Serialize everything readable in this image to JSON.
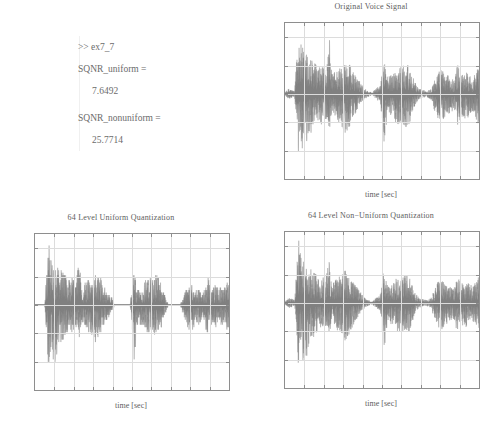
{
  "console": {
    "prompt_line": ">> ex7_7",
    "var1_name": "SQNR_uniform =",
    "var1_value": "7.6492",
    "var2_name": "SQNR_nonuniform =",
    "var2_value": "25.7714"
  },
  "colors": {
    "waveform": "#808080",
    "axis": "#8e8e8e",
    "grid": "#dcdcdc",
    "text": "#5d5d5d"
  },
  "figures": [
    {
      "id": "original-voice-signal",
      "title": "Original Voice Signal",
      "xlabel": "time [sec]",
      "ylabel": "",
      "xticks": [
        "1",
        "2",
        "3",
        "4",
        "5",
        "6",
        "7",
        "8",
        "9",
        "10"
      ],
      "yticks": [
        "0.2",
        "0.1",
        "0",
        "-0.1",
        "-0.2",
        "-0.3"
      ]
    },
    {
      "id": "uniform-quantization",
      "title": "64 Level Uniform Quantization",
      "xlabel": "time [sec]",
      "ylabel": "",
      "xticks": [
        "1",
        "2",
        "3",
        "4",
        "5",
        "6",
        "7",
        "8",
        "9",
        "10"
      ],
      "yticks": [
        "0.2",
        "0.1",
        "0",
        "-0.1",
        "-0.2",
        "-0.3"
      ]
    },
    {
      "id": "nonuniform-quantization",
      "title": "64 Level Non−Uniform Quantization",
      "xlabel": "time [sec]",
      "ylabel": "",
      "xticks": [
        "1",
        "2",
        "3",
        "4",
        "5",
        "6",
        "7",
        "8",
        "9",
        "10"
      ],
      "yticks": [
        "0.2",
        "0.1",
        "0",
        "-0.1",
        "-0.2",
        "-0.3"
      ]
    }
  ],
  "chart_data": [
    {
      "type": "line",
      "id": "original-voice-signal",
      "title": "Original Voice Signal",
      "xlabel": "time [sec]",
      "ylabel": "",
      "xlim": [
        0,
        10
      ],
      "ylim": [
        -0.3,
        0.25
      ],
      "xticks": [
        1,
        2,
        3,
        4,
        5,
        6,
        7,
        8,
        9,
        10
      ],
      "yticks": [
        0.2,
        0.1,
        0,
        -0.1,
        -0.2,
        -0.3
      ],
      "grid": true,
      "legend": "none",
      "series": [
        {
          "name": "voice",
          "description": "speech waveform envelope, amplitude vs time",
          "envelope_time": [
            0.0,
            0.2,
            0.35,
            0.5,
            0.7,
            0.8,
            0.95,
            1.1,
            1.3,
            1.5,
            1.7,
            1.9,
            2.1,
            2.3,
            2.35,
            2.5,
            2.7,
            2.9,
            3.1,
            3.3,
            3.5,
            3.7,
            3.9,
            4.1,
            4.3,
            4.5,
            4.7,
            4.9,
            5.0,
            5.1,
            5.3,
            5.5,
            5.7,
            5.9,
            6.1,
            6.3,
            6.5,
            6.7,
            6.9,
            7.1,
            7.3,
            7.5,
            7.7,
            7.9,
            8.1,
            8.3,
            8.5,
            8.7,
            8.9,
            9.1,
            9.3,
            9.5,
            9.7,
            9.9,
            10.0
          ],
          "envelope_pos": [
            0.005,
            0.02,
            0.015,
            0.01,
            0.25,
            0.18,
            0.16,
            0.15,
            0.13,
            0.12,
            0.09,
            0.1,
            0.08,
            0.2,
            0.09,
            0.08,
            0.09,
            0.1,
            0.12,
            0.11,
            0.08,
            0.06,
            0.04,
            0.02,
            0.01,
            0.005,
            0.02,
            0.03,
            0.07,
            0.14,
            0.06,
            0.07,
            0.09,
            0.1,
            0.1,
            0.11,
            0.08,
            0.04,
            0.02,
            0.015,
            0.01,
            0.02,
            0.05,
            0.08,
            0.09,
            0.07,
            0.06,
            0.05,
            0.11,
            0.07,
            0.08,
            0.07,
            0.06,
            0.09,
            0.1
          ],
          "envelope_neg": [
            -0.005,
            -0.02,
            -0.015,
            -0.01,
            -0.24,
            -0.17,
            -0.22,
            -0.2,
            -0.14,
            -0.13,
            -0.1,
            -0.11,
            -0.09,
            -0.14,
            -0.08,
            -0.07,
            -0.1,
            -0.11,
            -0.14,
            -0.12,
            -0.09,
            -0.06,
            -0.04,
            -0.02,
            -0.01,
            -0.005,
            -0.02,
            -0.03,
            -0.08,
            -0.21,
            -0.07,
            -0.08,
            -0.1,
            -0.11,
            -0.11,
            -0.12,
            -0.09,
            -0.04,
            -0.02,
            -0.015,
            -0.01,
            -0.02,
            -0.06,
            -0.09,
            -0.1,
            -0.08,
            -0.07,
            -0.06,
            -0.12,
            -0.08,
            -0.09,
            -0.08,
            -0.07,
            -0.1,
            -0.11
          ]
        }
      ]
    },
    {
      "type": "line",
      "id": "uniform-quantization",
      "title": "64 Level Uniform Quantization",
      "xlabel": "time [sec]",
      "ylabel": "",
      "xlim": [
        0,
        10
      ],
      "ylim": [
        -0.3,
        0.25
      ],
      "xticks": [
        1,
        2,
        3,
        4,
        5,
        6,
        7,
        8,
        9,
        10
      ],
      "yticks": [
        0.2,
        0.1,
        0,
        -0.1,
        -0.2,
        -0.3
      ],
      "grid": true,
      "legend": "none",
      "series": [
        {
          "name": "uniform-quantized",
          "description": "uniformly quantized speech (64 levels) — staircase, small amplitudes collapse to 0",
          "envelope_time": [
            0.0,
            0.2,
            0.35,
            0.5,
            0.7,
            0.8,
            0.95,
            1.1,
            1.3,
            1.5,
            1.7,
            1.9,
            2.1,
            2.3,
            2.35,
            2.5,
            2.7,
            2.9,
            3.1,
            3.3,
            3.5,
            3.7,
            3.9,
            4.1,
            4.3,
            4.5,
            4.7,
            4.9,
            5.0,
            5.1,
            5.3,
            5.5,
            5.7,
            5.9,
            6.1,
            6.3,
            6.5,
            6.7,
            6.9,
            7.1,
            7.3,
            7.5,
            7.7,
            7.9,
            8.1,
            8.3,
            8.5,
            8.7,
            8.9,
            9.1,
            9.3,
            9.5,
            9.7,
            9.9,
            10.0
          ],
          "envelope_pos": [
            0.0,
            0.0,
            0.0,
            0.0,
            0.235,
            0.17,
            0.155,
            0.145,
            0.125,
            0.115,
            0.085,
            0.095,
            0.075,
            0.205,
            0.085,
            0.075,
            0.085,
            0.095,
            0.115,
            0.105,
            0.075,
            0.055,
            0.035,
            0.0,
            0.0,
            0.0,
            0.0,
            0.0,
            0.065,
            0.14,
            0.055,
            0.065,
            0.085,
            0.095,
            0.095,
            0.105,
            0.075,
            0.035,
            0.0,
            0.0,
            0.0,
            0.0,
            0.045,
            0.075,
            0.085,
            0.065,
            0.055,
            0.045,
            0.105,
            0.065,
            0.075,
            0.065,
            0.055,
            0.085,
            0.095
          ],
          "envelope_neg": [
            0.0,
            0.0,
            0.0,
            0.0,
            -0.235,
            -0.165,
            -0.215,
            -0.195,
            -0.135,
            -0.125,
            -0.095,
            -0.105,
            -0.085,
            -0.135,
            -0.075,
            -0.065,
            -0.095,
            -0.105,
            -0.135,
            -0.115,
            -0.085,
            -0.055,
            -0.035,
            0.0,
            0.0,
            0.0,
            0.0,
            0.0,
            -0.075,
            -0.205,
            -0.065,
            -0.075,
            -0.095,
            -0.105,
            -0.105,
            -0.115,
            -0.085,
            -0.035,
            0.0,
            0.0,
            0.0,
            0.0,
            -0.055,
            -0.085,
            -0.095,
            -0.075,
            -0.065,
            -0.055,
            -0.115,
            -0.075,
            -0.085,
            -0.075,
            -0.065,
            -0.095,
            -0.105
          ]
        }
      ]
    },
    {
      "type": "line",
      "id": "nonuniform-quantization",
      "title": "64 Level Non−Uniform Quantization",
      "xlabel": "time [sec]",
      "ylabel": "",
      "xlim": [
        0,
        10
      ],
      "ylim": [
        -0.3,
        0.25
      ],
      "xticks": [
        1,
        2,
        3,
        4,
        5,
        6,
        7,
        8,
        9,
        10
      ],
      "yticks": [
        0.2,
        0.1,
        0,
        -0.1,
        -0.2,
        -0.3
      ],
      "grid": true,
      "legend": "none",
      "series": [
        {
          "name": "nonuniform-quantized",
          "description": "mu-law non-uniformly quantized speech (64 levels) — closely tracks original",
          "envelope_time": [
            0.0,
            0.2,
            0.35,
            0.5,
            0.7,
            0.8,
            0.95,
            1.1,
            1.3,
            1.5,
            1.7,
            1.9,
            2.1,
            2.3,
            2.35,
            2.5,
            2.7,
            2.9,
            3.1,
            3.3,
            3.5,
            3.7,
            3.9,
            4.1,
            4.3,
            4.5,
            4.7,
            4.9,
            5.0,
            5.1,
            5.3,
            5.5,
            5.7,
            5.9,
            6.1,
            6.3,
            6.5,
            6.7,
            6.9,
            7.1,
            7.3,
            7.5,
            7.7,
            7.9,
            8.1,
            8.3,
            8.5,
            8.7,
            8.9,
            9.1,
            9.3,
            9.5,
            9.7,
            9.9,
            10.0
          ],
          "envelope_pos": [
            0.005,
            0.02,
            0.015,
            0.01,
            0.225,
            0.175,
            0.155,
            0.145,
            0.125,
            0.115,
            0.085,
            0.1,
            0.078,
            0.19,
            0.085,
            0.078,
            0.088,
            0.1,
            0.115,
            0.105,
            0.078,
            0.058,
            0.038,
            0.018,
            0.01,
            0.005,
            0.018,
            0.028,
            0.068,
            0.135,
            0.058,
            0.068,
            0.088,
            0.098,
            0.098,
            0.105,
            0.078,
            0.038,
            0.018,
            0.014,
            0.01,
            0.018,
            0.048,
            0.078,
            0.088,
            0.068,
            0.058,
            0.048,
            0.095,
            0.068,
            0.078,
            0.068,
            0.058,
            0.088,
            0.095
          ],
          "envelope_neg": [
            -0.005,
            -0.02,
            -0.015,
            -0.01,
            -0.23,
            -0.165,
            -0.215,
            -0.195,
            -0.135,
            -0.125,
            -0.098,
            -0.105,
            -0.088,
            -0.135,
            -0.078,
            -0.068,
            -0.098,
            -0.105,
            -0.135,
            -0.115,
            -0.088,
            -0.058,
            -0.038,
            -0.018,
            -0.01,
            -0.005,
            -0.018,
            -0.028,
            -0.078,
            -0.195,
            -0.068,
            -0.078,
            -0.098,
            -0.105,
            -0.105,
            -0.115,
            -0.088,
            -0.038,
            -0.018,
            -0.014,
            -0.01,
            -0.018,
            -0.058,
            -0.088,
            -0.098,
            -0.078,
            -0.068,
            -0.058,
            -0.115,
            -0.078,
            -0.088,
            -0.078,
            -0.068,
            -0.098,
            -0.105
          ]
        }
      ]
    }
  ],
  "footer": {
    "smudge": ""
  }
}
